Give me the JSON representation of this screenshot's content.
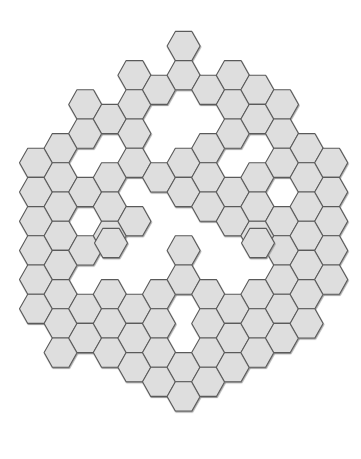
{
  "artwork": {
    "title": "Hexagonal Tiling Pattern",
    "description": "Abstract hexagonal mosaic forming a rounded hexagonal silhouette with interior voids",
    "background_color": "#ffffff",
    "canvas": {
      "width": 361,
      "height": 459
    }
  },
  "hex_style": {
    "fill_color": "#dedede",
    "stroke_color": "#5a5a5a",
    "stroke_width": 1.1,
    "shadow_color": "#8a8a8a",
    "orientation": "flat-top",
    "hex_width": 33,
    "hex_height": 29.2,
    "col_pitch": 24.6,
    "row_pitch": 29.2,
    "origin_x": 36,
    "origin_y": 46
  },
  "chart_data": {
    "type": "scatter",
    "xlabel": "",
    "ylabel": "",
    "legend": [],
    "grid": false,
    "note": "Each point is one filled hexagon tile, given as [column, row] on a flat-top hex lattice. Odd columns are offset downward by half a row pitch.",
    "columns": 13,
    "rows": 13,
    "tile_count": 136,
    "cells": [
      [
        0,
        4
      ],
      [
        0,
        5
      ],
      [
        0,
        6
      ],
      [
        0,
        7
      ],
      [
        0,
        8
      ],
      [
        0,
        9
      ],
      [
        1,
        3
      ],
      [
        1,
        4
      ],
      [
        1,
        5
      ],
      [
        1,
        6
      ],
      [
        1,
        7
      ],
      [
        1,
        8
      ],
      [
        1,
        9
      ],
      [
        1,
        10
      ],
      [
        2,
        2
      ],
      [
        2,
        3
      ],
      [
        2,
        5
      ],
      [
        2,
        7
      ],
      [
        2,
        9
      ],
      [
        2,
        10
      ],
      [
        3,
        2
      ],
      [
        3,
        4
      ],
      [
        3,
        5
      ],
      [
        3,
        6
      ],
      [
        3,
        8
      ],
      [
        3,
        9
      ],
      [
        3,
        10
      ],
      [
        4,
        1
      ],
      [
        4,
        2
      ],
      [
        4,
        3
      ],
      [
        4,
        4
      ],
      [
        4,
        6
      ],
      [
        4,
        9
      ],
      [
        4,
        10
      ],
      [
        4,
        11
      ],
      [
        5,
        1
      ],
      [
        5,
        4
      ],
      [
        5,
        8
      ],
      [
        5,
        9
      ],
      [
        5,
        10
      ],
      [
        5,
        11
      ],
      [
        6,
        0
      ],
      [
        6,
        1
      ],
      [
        6,
        4
      ],
      [
        6,
        5
      ],
      [
        6,
        7
      ],
      [
        6,
        8
      ],
      [
        6,
        11
      ],
      [
        6,
        12
      ],
      [
        7,
        1
      ],
      [
        7,
        3
      ],
      [
        7,
        4
      ],
      [
        7,
        5
      ],
      [
        7,
        8
      ],
      [
        7,
        9
      ],
      [
        7,
        10
      ],
      [
        7,
        11
      ],
      [
        8,
        1
      ],
      [
        8,
        2
      ],
      [
        8,
        3
      ],
      [
        8,
        5
      ],
      [
        8,
        6
      ],
      [
        8,
        9
      ],
      [
        8,
        10
      ],
      [
        8,
        11
      ],
      [
        9,
        1
      ],
      [
        9,
        2
      ],
      [
        9,
        4
      ],
      [
        9,
        5
      ],
      [
        9,
        6
      ],
      [
        9,
        8
      ],
      [
        9,
        9
      ],
      [
        9,
        10
      ],
      [
        10,
        2
      ],
      [
        10,
        3
      ],
      [
        10,
        4
      ],
      [
        10,
        6
      ],
      [
        10,
        7
      ],
      [
        10,
        8
      ],
      [
        10,
        9
      ],
      [
        10,
        10
      ],
      [
        11,
        3
      ],
      [
        11,
        4
      ],
      [
        11,
        5
      ],
      [
        11,
        6
      ],
      [
        11,
        7
      ],
      [
        11,
        8
      ],
      [
        11,
        9
      ],
      [
        12,
        4
      ],
      [
        12,
        5
      ],
      [
        12,
        6
      ],
      [
        12,
        7
      ],
      [
        12,
        8
      ]
    ],
    "extra_cells": [
      {
        "name": "isolated-hex-left",
        "x": 111,
        "y": 243
      },
      {
        "name": "isolated-hex-right",
        "x": 258,
        "y": 243
      }
    ],
    "voids": [
      {
        "name": "flower-void-top-center",
        "x": 177,
        "y": 138
      },
      {
        "name": "ring-void-upper-left",
        "x": 85,
        "y": 133
      },
      {
        "name": "ring-void-upper-left-2",
        "x": 61,
        "y": 176
      },
      {
        "name": "ring-void-upper-right",
        "x": 281,
        "y": 133
      },
      {
        "name": "ring-void-lower-left",
        "x": 61,
        "y": 306
      },
      {
        "name": "ring-void-lower-right",
        "x": 281,
        "y": 306
      }
    ]
  }
}
